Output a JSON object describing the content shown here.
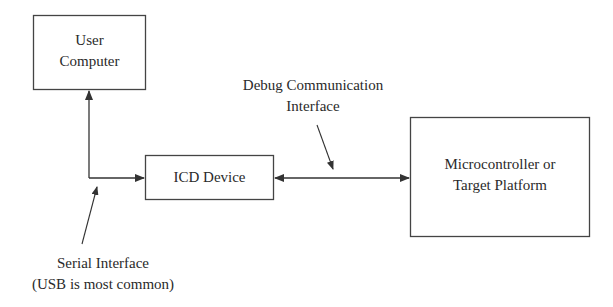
{
  "diagram": {
    "nodes": [
      {
        "id": "user-computer",
        "lines": [
          "User",
          "Computer"
        ]
      },
      {
        "id": "icd-device",
        "lines": [
          "ICD Device"
        ]
      },
      {
        "id": "target",
        "lines": [
          "Microcontroller or",
          "Target Platform"
        ]
      }
    ],
    "annotations": {
      "debug": [
        "Debug Communication",
        "Interface"
      ],
      "serial": [
        "Serial Interface",
        "(USB is most common)"
      ]
    },
    "edges": [
      {
        "from": "icd-device",
        "to": "user-computer",
        "label": "Serial Interface (USB is most common)",
        "direction": "to"
      },
      {
        "from": "icd-device",
        "to": "target",
        "label": "Debug Communication Interface",
        "direction": "both"
      }
    ],
    "colors": {
      "stroke": "#333333",
      "text": "#2a2a2a",
      "background": "#ffffff"
    }
  }
}
